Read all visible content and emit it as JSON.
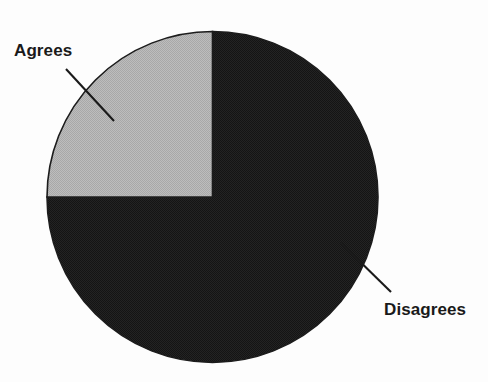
{
  "figure": {
    "background_color": "#fdfdfd",
    "width": 488,
    "height": 382
  },
  "chart_data": {
    "type": "pie",
    "title": "",
    "subtitle": "",
    "xlabel": "",
    "ylabel": "",
    "grid": false,
    "legend_position": "none",
    "labels_position": "callout-leader-lines",
    "categories": [
      "Agrees",
      "Disagrees"
    ],
    "values": [
      25,
      75
    ],
    "units": "percent",
    "start_angle_deg": 0,
    "direction": "counterclockwise",
    "slices": [
      {
        "label": "Agrees",
        "value": 25,
        "fraction": 0.25,
        "angle_deg": 90,
        "color": "#b4b4b4",
        "edge_color": "#1c1c1c",
        "quadrant": "upper-left"
      },
      {
        "label": "Disagrees",
        "value": 75,
        "fraction": 0.75,
        "angle_deg": 270,
        "color": "#1f1f1f",
        "edge_color": "#1c1c1c",
        "quadrant": "upper-right-lower-half"
      }
    ],
    "annotations": [
      {
        "text": "Agrees",
        "leader_from": [
          66,
          69
        ],
        "leader_to": [
          114,
          121
        ]
      },
      {
        "text": "Disagrees",
        "leader_from": [
          341,
          243
        ],
        "leader_to": [
          391,
          292
        ]
      }
    ]
  },
  "labels": {
    "agrees": "Agrees",
    "disagrees": "Disagrees"
  },
  "colors": {
    "agrees_fill": "#b4b4b4",
    "disagrees_fill": "#1f1f1f",
    "outline": "#1c1c1c",
    "text": "#1a1a1a",
    "leader_line": "#1a1a1a",
    "background": "#fdfdfd"
  }
}
